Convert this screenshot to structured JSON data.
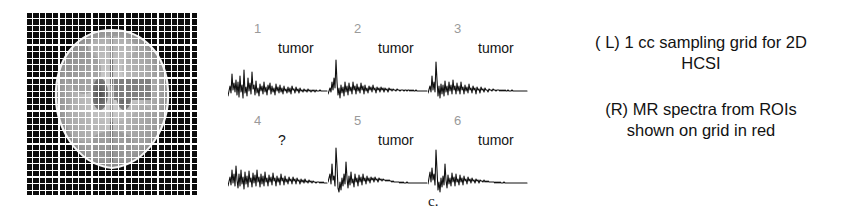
{
  "figure": {
    "subfigure_label": "c.",
    "background_color": "#ffffff"
  },
  "grid_panel": {
    "name": "1 cc sampling grid over axial brain MR image",
    "grid_color": "#ffffff",
    "background_color": "#0a0a0a",
    "roi_color": "#808080",
    "columns": 26,
    "rows": 28,
    "cell_size_px": 6.6
  },
  "spectra_panel": {
    "tag_tumor": "tumor",
    "tag_unknown": "?",
    "cells": [
      {
        "index": "1",
        "tag": "tumor",
        "row": 0,
        "col": 0,
        "trace": "M0,44 L2,34 L3,41 L4,22 L5,38 L6,31 L7,40 L8,28 L9,43 L10,30 L11,45 L12,24 L13,40 L14,33 L15,46 L16,18 L17,41 L18,35 L19,44 L20,26 L21,39 L22,31 L23,42 L24,20 L25,37 L26,33 L27,43 L28,29 L29,41 L30,36 L31,44 L32,32 L33,39 L34,34 L35,42 L36,30 L37,40 L38,35 L39,43 L40,33 L41,38 L42,31 L43,42 L44,34 L45,40 L46,36 L47,43 L48,32 L49,39 L50,35 L51,41 L52,33 L53,40 L54,36 L55,42 L56,34 L57,39 L58,37 L59,41 L60,35 L61,40 L62,36 L63,42 L64,34 L65,38 L66,37 L67,41 L68,35 L69,39 L70,37 L71,41 L72,36 L73,39 L74,38 L75,40 L76,37 L77,39 L78,38 L79,40 L80,37 L81,39 L82,38 L83,40 L84,38 L85,39 L86,38 L87,40 L88,38 L89,39 L90,39 L91,39 L92,38 L93,39 L94,39 L95,39 L96,39 L97,39 L98,39 L99,39"
      },
      {
        "index": "2",
        "tag": "tumor",
        "row": 0,
        "col": 1,
        "trace": "M0,42 L2,36 L3,40 L4,30 L5,38 L6,26 L7,36 L8,8 L9,30 L10,43 L11,36 L12,46 L13,33 L14,41 L15,35 L16,44 L17,30 L18,40 L19,34 L20,43 L21,31 L22,39 L23,35 L24,42 L25,30 L26,38 L27,34 L28,42 L29,32 L30,39 L31,35 L32,41 L33,31 L34,38 L35,34 L36,42 L37,33 L38,39 L39,36 L40,41 L41,34 L42,38 L43,35 L44,40 L45,33 L46,38 L47,36 L48,41 L49,35 L50,38 L51,36 L52,40 L53,35 L54,38 L55,36 L56,40 L57,36 L58,38 L59,37 L60,40 L61,36 L62,38 L63,37 L64,39 L65,37 L66,38 L67,38 L68,39 L69,37 L70,38 L71,38 L72,39 L73,38 L74,38 L75,38 L76,39 L77,38 L78,38 L79,39 L80,38 L81,38 L82,39 L83,38 L84,39 L85,38 L86,39 L87,39 L88,38 L89,39 L90,39 L91,39 L92,39 L93,39 L94,39 L95,39 L96,39 L97,39 L98,39 L99,39"
      },
      {
        "index": "3",
        "tag": "tumor",
        "row": 0,
        "col": 2,
        "trace": "M0,41 L2,34 L3,40 L4,24 L5,38 L6,30 L7,40 L8,10 L9,28 L10,44 L11,34 L12,46 L13,32 L14,42 L15,33 L16,44 L17,29 L18,40 L19,34 L20,43 L21,30 L22,39 L23,33 L24,42 L25,28 L26,38 L27,34 L28,42 L29,31 L30,39 L31,34 L32,42 L33,30 L34,38 L35,35 L36,42 L37,33 L38,39 L39,35 L40,41 L41,32 L42,38 L43,36 L44,41 L45,34 L46,38 L47,36 L48,42 L49,35 L50,38 L51,37 L52,41 L53,35 L54,38 L55,37 L56,40 L57,36 L58,38 L59,38 L60,40 L61,37 L62,38 L63,38 L64,39 L65,37 L66,38 L67,38 L68,39 L69,38 L70,38 L71,38 L72,39 L73,38 L74,39 L75,38 L76,39 L77,38 L78,39 L79,39 L80,38 L81,39 L82,39 L83,39 L84,38 L85,39 L86,39 L87,39 L88,39 L89,39 L90,39 L91,39 L92,39 L93,39 L94,39 L95,39 L96,39 L97,39 L98,39 L99,39"
      },
      {
        "index": "4",
        "tag": "?",
        "row": 1,
        "col": 0,
        "trace": "M0,42 L2,33 L3,41 L4,26 L5,39 L6,30 L7,42 L8,22 L9,36 L10,44 L11,30 L12,42 L13,26 L14,40 L15,33 L16,45 L17,28 L18,40 L19,32 L20,43 L21,27 L22,38 L23,34 L24,43 L25,29 L26,39 L27,31 L28,42 L29,26 L30,38 L31,33 L32,43 L33,30 L34,40 L35,32 L36,42 L37,28 L38,38 L39,34 L40,42 L41,31 L42,38 L43,33 L44,41 L45,29 L46,37 L47,34 L48,42 L49,32 L50,38 L51,34 L52,41 L53,30 L54,37 L55,34 L56,41 L57,32 L58,38 L59,35 L60,40 L61,33 L62,37 L63,35 L64,40 L65,33 L66,37 L67,35 L68,40 L69,34 L70,37 L71,36 L72,40 L73,35 L74,38 L75,36 L76,39 L77,35 L78,38 L79,37 L80,39 L81,36 L82,38 L83,37 L84,39 L85,37 L86,38 L87,38 L88,39 L89,38 L90,38 L91,38 L92,39 L93,38 L94,39 L95,38 L96,39 L97,39 L98,39 L99,39"
      },
      {
        "index": "5",
        "tag": "tumor",
        "row": 1,
        "col": 1,
        "trace": "M0,38 L2,30 L3,40 L4,20 L5,36 L6,32 L7,42 L8,4 L9,22 L10,44 L11,48 L12,38 L13,46 L14,34 L15,42 L16,30 L17,40 L18,18 L19,34 L20,44 L21,32 L22,41 L23,28 L24,39 L25,35 L26,43 L27,30 L28,38 L29,34 L30,42 L31,31 L32,38 L33,33 L34,41 L35,30 L36,37 L37,34 L38,40 L39,32 L40,37 L41,34 L42,39 L43,33 L44,36 L45,34 L46,38 L47,33 L48,36 L49,35 L50,38 L51,34 L52,36 L53,35 L54,37 L55,35 L56,36 L57,36 L58,37 L59,36 L60,37 L61,36 L62,37 L63,37 L64,38 L65,37 L66,38 L67,38 L68,38 L69,38 L70,38 L71,38 L72,39 L73,38 L74,39 L75,38 L76,39 L77,39 L78,39 L79,38 L80,39 L81,39 L82,39 L83,39 L84,39 L85,39 L86,39 L87,39 L88,39 L89,39 L90,39 L91,39 L92,39 L93,39 L94,39 L95,39 L96,39 L97,39 L98,39 L99,39"
      },
      {
        "index": "6",
        "tag": "tumor",
        "row": 1,
        "col": 2,
        "trace": "M0,40 L2,28 L3,38 L4,24 L5,36 L6,30 L7,41 L8,6 L9,26 L10,46 L11,38 L12,48 L13,34 L14,43 L15,32 L16,41 L17,20 L18,36 L19,44 L20,31 L21,40 L22,34 L23,42 L24,29 L25,38 L26,33 L27,42 L28,30 L29,38 L30,35 L31,41 L32,31 L33,38 L34,34 L35,41 L36,32 L37,37 L38,35 L39,40 L40,33 L41,37 L42,35 L43,39 L44,34 L45,37 L46,36 L47,39 L48,35 L49,37 L50,36 L51,39 L52,36 L53,37 L54,37 L55,38 L56,36 L57,38 L58,37 L59,38 L60,37 L61,38 L62,38 L63,38 L64,38 L65,38 L66,38 L67,39 L68,38 L69,39 L70,38 L71,39 L72,38 L73,39 L74,39 L75,39 L76,38 L77,39 L78,39 L79,39 L80,39 L81,39 L82,39 L83,39 L84,39 L85,39 L86,39 L87,39 L88,39 L89,39 L90,39 L91,39 L92,39 L93,39 L94,39 L95,39 L96,39 L97,39 L98,39 L99,39"
      }
    ]
  },
  "legend": {
    "entries": [
      {
        "line1": "( L)  1 cc sampling grid for 2D",
        "line2": "HCSI"
      },
      {
        "line1": "(R)  MR spectra from ROIs",
        "line2": "shown on grid in red"
      }
    ]
  }
}
